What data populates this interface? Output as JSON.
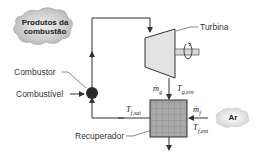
{
  "labels": {
    "products": "Produtos da combustão",
    "products_line1": "Produtos da",
    "products_line2": "combustão",
    "turbine": "Turbina",
    "combustor": "Combustor",
    "fuel": "Combustível",
    "recuperator": "Recuperador",
    "air": "Ar"
  },
  "symbols": {
    "mg": "ṁ",
    "mg_sub": "g",
    "tg_ent": "T",
    "tg_ent_sub": "g,ent",
    "tf_sai": "T",
    "tf_sai_sub": "f,sai",
    "mf": "ṁ",
    "mf_sub": "f",
    "tf_ent": "T",
    "tf_ent_sub": "f,ent"
  },
  "colors": {
    "line": "#333333",
    "cloud": "#bdbdbd",
    "turbine_fill": "#e3e3e3",
    "recuperator_fill": "#9a9a9a",
    "combustor_fill": "#2a2a2a"
  }
}
